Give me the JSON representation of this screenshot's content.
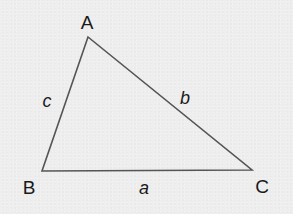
{
  "diagram": {
    "type": "triangle",
    "colors": {
      "background": "#eeeeee",
      "stroke": "#555555",
      "text": "#1a1a1a"
    },
    "vertices": [
      {
        "label": "A",
        "x": 88,
        "y": 37,
        "label_x": 87,
        "label_y": 29
      },
      {
        "label": "B",
        "x": 42,
        "y": 171,
        "label_x": 29,
        "label_y": 194
      },
      {
        "label": "C",
        "x": 252,
        "y": 170,
        "label_x": 262,
        "label_y": 193
      }
    ],
    "sides": [
      {
        "label": "a",
        "between": "B-C",
        "label_x": 144,
        "label_y": 194
      },
      {
        "label": "b",
        "between": "A-C",
        "label_x": 185,
        "label_y": 104
      },
      {
        "label": "c",
        "between": "A-B",
        "label_x": 47,
        "label_y": 107
      }
    ]
  }
}
